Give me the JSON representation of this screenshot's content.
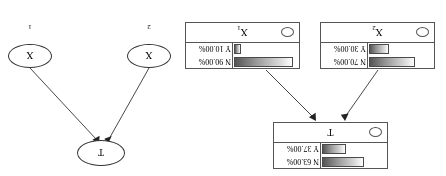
{
  "figure": {
    "orientation": "rotated-180",
    "background": "#ffffff",
    "line_color": "#333333"
  },
  "left_panel": {
    "name": "belief-network-with-bars",
    "nodes": [
      {
        "id": "T",
        "label": "T",
        "subscript": "",
        "states": [
          {
            "label": "N 63.00%",
            "state": "N",
            "probability": 63.0
          },
          {
            "label": "Y 37.00%",
            "state": "Y",
            "probability": 37.0
          }
        ]
      },
      {
        "id": "X2",
        "label": "X",
        "subscript": "2",
        "states": [
          {
            "label": "N 70.00%",
            "state": "N",
            "probability": 70.0
          },
          {
            "label": "Y 30.00%",
            "state": "Y",
            "probability": 30.0
          }
        ]
      },
      {
        "id": "X1",
        "label": "X",
        "subscript": "1",
        "states": [
          {
            "label": "N 90.00%",
            "state": "N",
            "probability": 90.0
          },
          {
            "label": "Y 10.00%",
            "state": "Y",
            "probability": 10.0
          }
        ]
      }
    ],
    "edges": [
      {
        "from": "X2",
        "to": "T"
      },
      {
        "from": "X1",
        "to": "T"
      }
    ]
  },
  "right_panel": {
    "name": "plain-dag",
    "nodes": [
      {
        "id": "T",
        "label": "T",
        "subscript": ""
      },
      {
        "id": "X2",
        "label": "X",
        "subscript": "2"
      },
      {
        "id": "X1",
        "label": "X",
        "subscript": "1"
      }
    ],
    "edges": [
      {
        "from": "X2",
        "to": "T"
      },
      {
        "from": "X1",
        "to": "T"
      }
    ]
  }
}
